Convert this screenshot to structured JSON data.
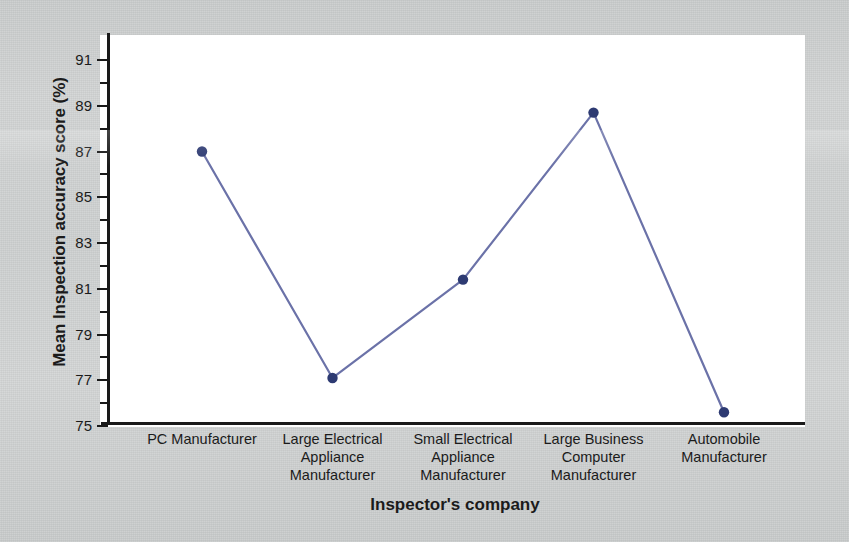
{
  "figure": {
    "background_color": "#cdd0d0",
    "plot_background_color": "#ffffff",
    "axis_color": "#1a1a1a"
  },
  "chart_data": {
    "type": "line",
    "title": "",
    "subtitle": "",
    "xlabel": "Inspector's company",
    "ylabel": "Mean Inspection accuracy score (%)",
    "categories": [
      "PC Manufacturer",
      "Large Electrical Appliance Manufacturer",
      "Small Electrical Appliance Manufacturer",
      "Large Business Computer Manufacturer",
      "Automobile Manufacturer"
    ],
    "category_lines": [
      [
        "PC Manufacturer"
      ],
      [
        "Large Electrical",
        "Appliance",
        "Manufacturer"
      ],
      [
        "Small Electrical",
        "Appliance",
        "Manufacturer"
      ],
      [
        "Large Business",
        "Computer",
        "Manufacturer"
      ],
      [
        "Automobile",
        "Manufacturer"
      ]
    ],
    "values": [
      87.0,
      77.1,
      81.4,
      88.7,
      75.6
    ],
    "ylim": [
      75,
      91.8
    ],
    "ytick_labels": [
      "75",
      "77",
      "79",
      "81",
      "83",
      "85",
      "87",
      "89",
      "91"
    ],
    "ytick_values": [
      75,
      77,
      79,
      81,
      83,
      85,
      87,
      89,
      91
    ],
    "yminor_values": [
      76,
      78,
      80,
      82,
      84,
      86,
      88,
      90
    ],
    "grid": false,
    "legend": null,
    "legend_position": "none",
    "series": [
      {
        "name": "Mean Inspection accuracy score (%)",
        "values": [
          87.0,
          77.1,
          81.4,
          88.7,
          75.6
        ],
        "line_color": "#6b72a8",
        "marker_color": "#2d3a72",
        "marker": "circle"
      }
    ]
  }
}
